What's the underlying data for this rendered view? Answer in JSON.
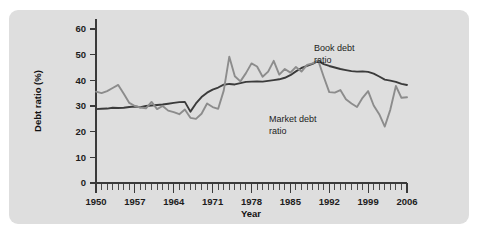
{
  "chart_data": {
    "type": "line",
    "title": "",
    "xlabel": "Year",
    "ylabel": "Debt ratio (%)",
    "xlim": [
      1950,
      2006
    ],
    "ylim": [
      0,
      60
    ],
    "yticks": [
      0,
      10,
      20,
      30,
      40,
      50,
      60
    ],
    "xticks": [
      1950,
      1957,
      1964,
      1971,
      1978,
      1985,
      1992,
      1999,
      2006
    ],
    "xtick_labels": [
      "1950",
      "1957",
      "1964",
      "1971",
      "1978",
      "1985",
      "1992",
      "1999",
      "2006"
    ],
    "ytick_labels": [
      "0",
      "10",
      "20",
      "30",
      "40",
      "50",
      "60"
    ],
    "minor_tick_interval": 1,
    "grid": false,
    "legend_position": "inline-annotation",
    "x": [
      1950,
      1951,
      1952,
      1953,
      1954,
      1955,
      1956,
      1957,
      1958,
      1959,
      1960,
      1961,
      1962,
      1963,
      1964,
      1965,
      1966,
      1967,
      1968,
      1969,
      1970,
      1971,
      1972,
      1973,
      1974,
      1975,
      1976,
      1977,
      1978,
      1979,
      1980,
      1981,
      1982,
      1983,
      1984,
      1985,
      1986,
      1987,
      1988,
      1989,
      1990,
      1991,
      1992,
      1993,
      1994,
      1995,
      1996,
      1997,
      1998,
      1999,
      2000,
      2001,
      2002,
      2003,
      2004,
      2005,
      2006
    ],
    "series": [
      {
        "name": "Book debt ratio",
        "color": "#3b3b3b",
        "label_text": "Book debt\nratio",
        "label_line1": "Book debt",
        "label_line2": "ratio",
        "values": [
          28.8,
          28.9,
          29.0,
          29.3,
          29.2,
          29.3,
          29.6,
          29.8,
          29.5,
          30.0,
          30.2,
          30.4,
          30.6,
          30.9,
          31.2,
          31.5,
          31.6,
          27.8,
          31.0,
          33.5,
          35.2,
          36.4,
          37.2,
          38.3,
          38.6,
          38.4,
          38.9,
          39.4,
          39.5,
          39.6,
          39.5,
          39.8,
          40.1,
          40.4,
          41.0,
          42.0,
          43.5,
          44.8,
          45.6,
          46.4,
          47.6,
          46.3,
          45.6,
          45.0,
          44.4,
          44.0,
          43.6,
          43.4,
          43.5,
          43.3,
          42.6,
          41.5,
          40.3,
          39.9,
          39.4,
          38.6,
          38.2
        ]
      },
      {
        "name": "Market debt ratio",
        "color": "#8c8c8c",
        "label_text": "Market debt\nratio",
        "label_line1": "Market debt",
        "label_line2": "ratio",
        "values": [
          35.6,
          35.0,
          35.8,
          37.0,
          38.2,
          34.8,
          31.2,
          30.0,
          29.4,
          29.1,
          31.6,
          28.8,
          30.0,
          28.2,
          27.6,
          26.8,
          28.6,
          25.4,
          25.0,
          27.0,
          31.0,
          29.6,
          28.9,
          36.0,
          49.2,
          41.6,
          39.6,
          42.8,
          46.6,
          45.4,
          41.4,
          43.4,
          47.6,
          42.2,
          44.4,
          43.0,
          45.2,
          43.4,
          46.0,
          46.6,
          47.8,
          41.4,
          35.4,
          35.2,
          36.2,
          32.6,
          31.0,
          29.6,
          33.2,
          35.8,
          30.2,
          26.8,
          22.0,
          28.6,
          37.8,
          33.2,
          33.4
        ]
      }
    ]
  }
}
